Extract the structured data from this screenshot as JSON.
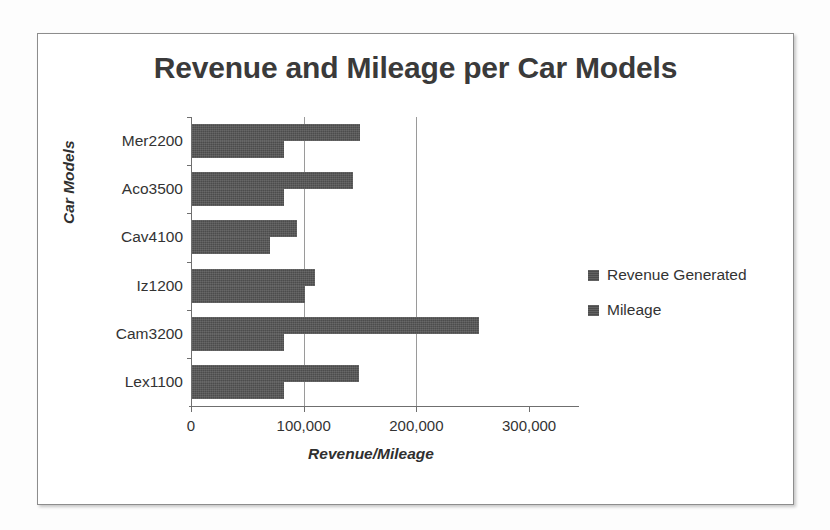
{
  "chart_data": {
    "type": "bar",
    "orientation": "horizontal",
    "title": "Revenue and Mileage per Car Models",
    "xlabel": "Revenue/Mileage",
    "ylabel": "Car Models",
    "categories": [
      "Mer2200",
      "Aco3500",
      "Cav4100",
      "Iz1200",
      "Cam3200",
      "Lex1100"
    ],
    "series": [
      {
        "name": "Revenue Generated",
        "color": "#4c4c4c",
        "values": [
          149000,
          143000,
          93000,
          109000,
          255000,
          148000
        ]
      },
      {
        "name": "Mileage",
        "color": "#4c4c4c",
        "values": [
          82000,
          82000,
          69000,
          100000,
          82000,
          82000
        ]
      }
    ],
    "xlim": [
      0,
      300000
    ],
    "xticks": [
      0,
      100000,
      200000,
      300000
    ],
    "xtick_labels": [
      "0",
      "100,000",
      "200,000",
      "300,000"
    ],
    "gridlines_at": [
      100000,
      200000
    ],
    "grid": true,
    "legend_position": "right"
  },
  "legend": {
    "items": [
      {
        "label": "Revenue Generated"
      },
      {
        "label": "Mileage"
      }
    ]
  }
}
